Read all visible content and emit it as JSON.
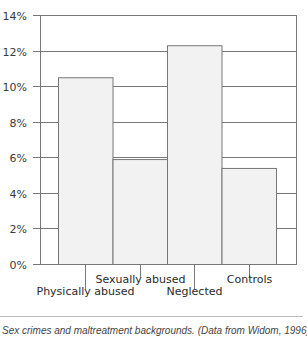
{
  "chart_data": {
    "type": "bar",
    "title": "",
    "xlabel": "",
    "ylabel": "",
    "categories": [
      "Physically abused",
      "Sexually abused",
      "Neglected",
      "Controls"
    ],
    "values": [
      10.5,
      5.9,
      12.3,
      5.4
    ],
    "unit": "%",
    "ylim": [
      0,
      14
    ],
    "yticks": [
      "0%",
      "2%",
      "4%",
      "6%",
      "8%",
      "10%",
      "12%",
      "14%"
    ],
    "grid": true,
    "legend": null,
    "bar_color": "#f2f2f2",
    "line_color": "#777777"
  },
  "caption": "Sex crimes and maltreatment backgrounds. (Data from Widom, 1996)"
}
